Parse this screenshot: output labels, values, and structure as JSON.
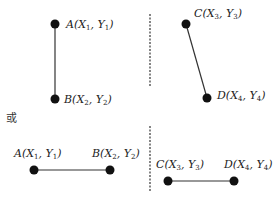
{
  "separator_text": "或",
  "panels": [
    {
      "name": "top-left",
      "points": [
        {
          "id": "A",
          "letter": "A",
          "x_sym": "X",
          "x_sub": "1",
          "y_sym": "Y",
          "y_sub": "1"
        },
        {
          "id": "B",
          "letter": "B",
          "x_sym": "X",
          "x_sub": "2",
          "y_sym": "Y",
          "y_sub": "2"
        }
      ],
      "orientation": "vertical"
    },
    {
      "name": "top-right",
      "points": [
        {
          "id": "C",
          "letter": "C",
          "x_sym": "X",
          "x_sub": "3",
          "y_sym": "Y",
          "y_sub": "3"
        },
        {
          "id": "D",
          "letter": "D",
          "x_sym": "X",
          "x_sub": "4",
          "y_sym": "Y",
          "y_sub": "4"
        }
      ],
      "orientation": "diagonal"
    },
    {
      "name": "bottom-left",
      "points": [
        {
          "id": "A",
          "letter": "A",
          "x_sym": "X",
          "x_sub": "1",
          "y_sym": "Y",
          "y_sub": "1"
        },
        {
          "id": "B",
          "letter": "B",
          "x_sym": "X",
          "x_sub": "2",
          "y_sym": "Y",
          "y_sub": "2"
        }
      ],
      "orientation": "horizontal"
    },
    {
      "name": "bottom-right",
      "points": [
        {
          "id": "C",
          "letter": "C",
          "x_sym": "X",
          "x_sub": "3",
          "y_sym": "Y",
          "y_sub": "3"
        },
        {
          "id": "D",
          "letter": "D",
          "x_sym": "X",
          "x_sub": "4",
          "y_sym": "Y",
          "y_sub": "4"
        }
      ],
      "orientation": "horizontal"
    }
  ],
  "colors": {
    "point": "#111111",
    "line": "#333333",
    "divider": "#444444"
  }
}
